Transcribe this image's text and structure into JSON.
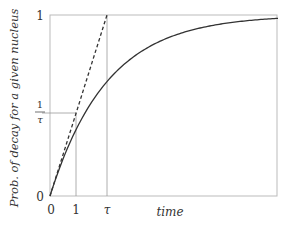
{
  "chart_data": {
    "type": "line",
    "title": "",
    "xlabel": "time",
    "ylabel": "Prob. of decay for a given nucleus",
    "x_ticks": [
      "0",
      "1",
      "τ"
    ],
    "y_ticks": [
      "0",
      "1/τ",
      "1"
    ],
    "x_range_in_tau": [
      0,
      4
    ],
    "ylim": [
      0,
      1
    ],
    "grid": false,
    "legend": null,
    "series": [
      {
        "name": "P(t) = 1 − e^(−t/τ)",
        "style": "solid",
        "x_over_tau": [
          0,
          0.25,
          0.5,
          0.75,
          1,
          1.5,
          2,
          2.5,
          3,
          3.5,
          4
        ],
        "values": [
          0,
          0.221,
          0.393,
          0.528,
          0.632,
          0.777,
          0.865,
          0.918,
          0.95,
          0.97,
          0.982
        ]
      },
      {
        "name": "tangent at origin: t/τ",
        "style": "dashed",
        "x_over_tau": [
          0,
          1
        ],
        "values": [
          0,
          1
        ]
      }
    ],
    "guides": [
      {
        "type": "vertical",
        "at": "1",
        "x_over_tau": 0.456
      },
      {
        "type": "vertical",
        "at": "τ",
        "x_over_tau": 1.0
      },
      {
        "type": "horizontal",
        "at": "1/τ",
        "value": 0.456
      }
    ]
  },
  "labels": {
    "y_axis": "Prob. of decay for a given nucleus",
    "x_axis": "time",
    "y_tick_top": "1",
    "y_tick_mid_num": "1",
    "y_tick_mid_den": "τ",
    "y_tick_zero": "0",
    "x_tick_zero": "0",
    "x_tick_one": "1",
    "x_tick_tau": "τ"
  },
  "colors": {
    "curve": "#333333",
    "frame": "#bbbbbb",
    "guide": "#999999",
    "text": "#333333"
  }
}
